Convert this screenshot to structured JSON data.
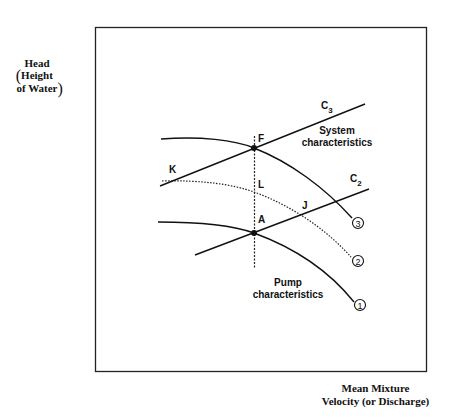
{
  "axes": {
    "y_label_line1": "Head",
    "y_label_line2": "Height",
    "y_label_line3": "of Water",
    "x_label_line1": "Mean Mixture",
    "x_label_line2": "Velocity (or Discharge)"
  },
  "curves": {
    "system_label_c3": "C",
    "system_label_c3_sub": "3",
    "system_label_c2": "C",
    "system_label_c2_sub": "2",
    "system_char_line1": "System",
    "system_char_line2": "characteristics",
    "pump_char_line1": "Pump",
    "pump_char_line2": "characteristics",
    "curve_markers": [
      "1",
      "2",
      "3"
    ]
  },
  "points": {
    "F": "F",
    "K": "K",
    "L": "L",
    "A": "A",
    "J": "J"
  },
  "colors": {
    "line": "#111111",
    "background": "#ffffff"
  }
}
